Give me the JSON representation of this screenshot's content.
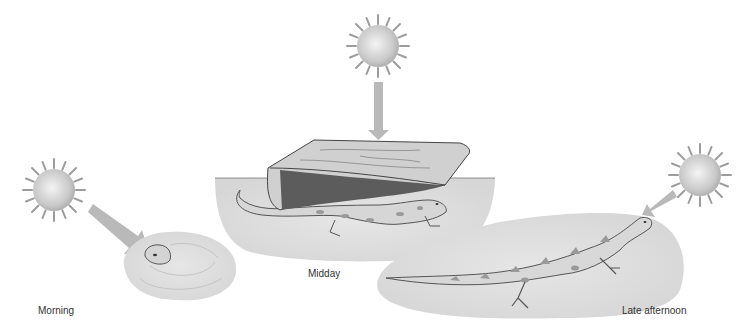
{
  "diagram": {
    "type": "behavioral-thermoregulation-illustration",
    "panels": [
      {
        "id": "morning",
        "label": "Morning",
        "description": "Lizard head peeking out of burrow in sand; sun low at left with arrow pointing down-right"
      },
      {
        "id": "midday",
        "label": "Midday",
        "description": "Lizard sheltering under a flat rock; sun overhead with arrow pointing straight down"
      },
      {
        "id": "late-afternoon",
        "label": "Late afternoon",
        "description": "Lizard basking fully exposed on sand; sun low at right with arrow pointing down-left"
      }
    ],
    "colors": {
      "sun": "#c8c8c8",
      "arrow": "#b9b9b9",
      "ground": "#dedede",
      "rock": "#cfcfcf",
      "rock_edge": "#555555",
      "lizard": "#d9d9d9",
      "lizard_spots": "#9a9a9a",
      "outline": "#555555"
    }
  }
}
